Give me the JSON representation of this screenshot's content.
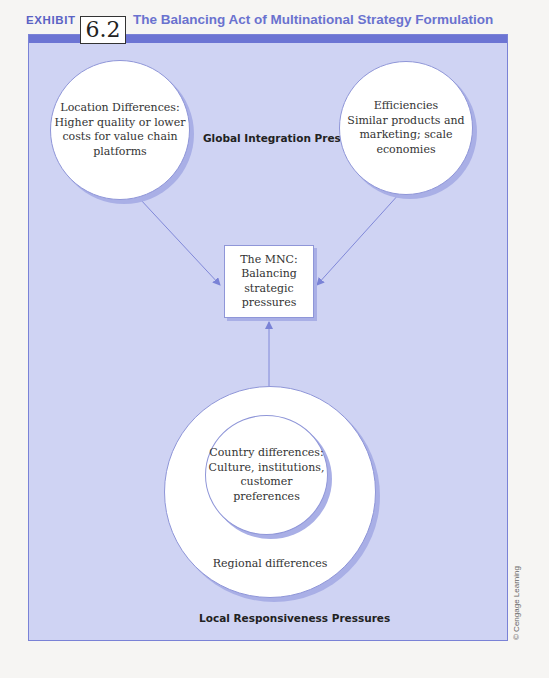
{
  "header": {
    "exhibit_label": "EXHIBIT",
    "exhibit_number": "6.2",
    "title": "The Balancing Act of Multinational Strategy Formulation"
  },
  "colors": {
    "accent": "#6c74d3",
    "panel_background": "#cfd3f3",
    "node_fill": "#ffffff",
    "title_text": "#6a72cf"
  },
  "diagram": {
    "global_label": "Global Integration Pressures",
    "local_label": "Local Responsiveness Pressures",
    "nodes": {
      "location": {
        "line1": "Location Differences:",
        "line2": "Higher quality or lower",
        "line3": "costs for value chain",
        "line4": "platforms"
      },
      "efficiencies": {
        "line1": "Efficiencies",
        "line2": "Similar products and",
        "line3": "marketing; scale",
        "line4": "economies"
      },
      "mnc": {
        "line1": "The MNC:",
        "line2": "Balancing strategic",
        "line3": "pressures"
      },
      "country": {
        "line1": "Country differences:",
        "line2": "Culture, institutions,",
        "line3": "customer preferences"
      },
      "regional": {
        "label": "Regional differences"
      }
    },
    "edges": [
      {
        "from": "location",
        "to": "mnc"
      },
      {
        "from": "efficiencies",
        "to": "mnc"
      },
      {
        "from": "regional",
        "to": "mnc"
      }
    ]
  },
  "copyright": "© Cengage Learning"
}
